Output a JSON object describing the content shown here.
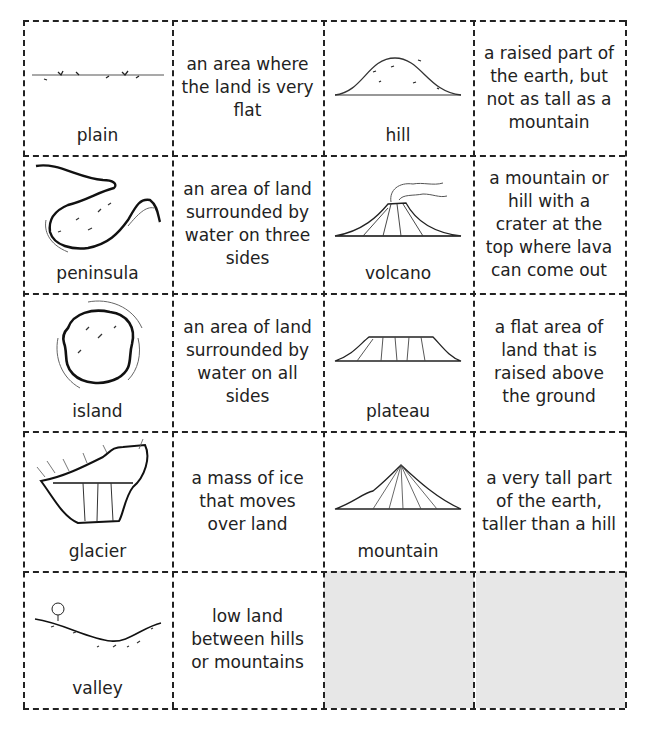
{
  "worksheet": {
    "cards": [
      {
        "term": "plain",
        "icon": "plain-icon",
        "definition": "an area where the land is very flat",
        "definition_lines": [
          "an area where",
          "the land is",
          "very flat"
        ]
      },
      {
        "term": "hill",
        "icon": "hill-icon",
        "definition": "a raised part of the earth, but not as tall as a mountain",
        "definition_lines": [
          "a raised part of",
          "the earth, but",
          "not as tall as",
          "a mountain"
        ]
      },
      {
        "term": "peninsula",
        "icon": "peninsula-icon",
        "definition": "an area of land surrounded by water on three sides",
        "definition_lines": [
          "an area of land",
          "surrounded",
          "by water on",
          "three sides"
        ]
      },
      {
        "term": "volcano",
        "icon": "volcano-icon",
        "definition": "a mountain or hill with a crater at the top where lava can come out",
        "definition_lines": [
          "a mountain",
          "or hill with a",
          "crater at the top",
          "where lava can",
          "come out"
        ]
      },
      {
        "term": "island",
        "icon": "island-icon",
        "definition": "an area of land surrounded by water on all sides",
        "definition_lines": [
          "an area of land",
          "surrounded by",
          "water on all sides"
        ]
      },
      {
        "term": "plateau",
        "icon": "plateau-icon",
        "definition": "a flat area of land that is raised above the ground",
        "definition_lines": [
          "a flat area of",
          "land that is",
          "raised above",
          "the ground"
        ]
      },
      {
        "term": "glacier",
        "icon": "glacier-icon",
        "definition": "a mass of ice that moves over land",
        "definition_lines": [
          "a mass of ice that",
          "moves over land"
        ]
      },
      {
        "term": "mountain",
        "icon": "mountain-icon",
        "definition": "a very tall part of the earth, taller than a hill",
        "definition_lines": [
          "a very tall part of",
          "the earth, taller",
          "than a hill"
        ]
      },
      {
        "term": "valley",
        "icon": "valley-icon",
        "definition": "low land between hills or mountains",
        "definition_lines": [
          "low land",
          "between hills",
          "or mountains"
        ]
      }
    ],
    "blank_cells": 2,
    "colors": {
      "line": "#222222",
      "blank_fill": "#e7e7e7",
      "background": "#ffffff"
    }
  }
}
